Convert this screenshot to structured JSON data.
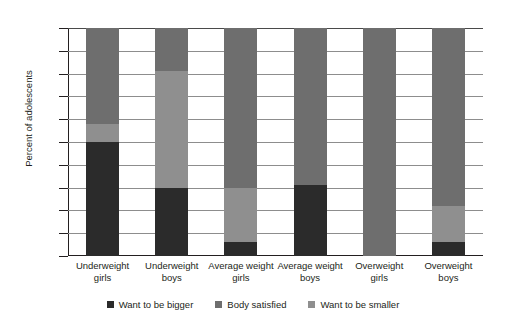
{
  "chart_data": {
    "type": "bar",
    "subtype": "stacked-bar-100",
    "title": "",
    "xlabel": "",
    "ylabel": "Percent of adolescents",
    "ylim": [
      0,
      100
    ],
    "yticks": [
      0,
      10,
      20,
      30,
      40,
      50,
      60,
      70,
      80,
      90,
      100
    ],
    "grid": true,
    "legend_position": "bottom",
    "categories": [
      "Underweight girls",
      "Underweight boys",
      "Average weight girls",
      "Average weight boys",
      "Overweight girls",
      "Overweight boys"
    ],
    "category_lines": [
      [
        "Underweight",
        "girls"
      ],
      [
        "Underweight",
        "boys"
      ],
      [
        "Average weight",
        "girls"
      ],
      [
        "Average weight",
        "boys"
      ],
      [
        "Overweight",
        "girls"
      ],
      [
        "Overweight",
        "boys"
      ]
    ],
    "series": [
      {
        "name": "Want to be bigger",
        "color": "#2b2b2b",
        "values": [
          50,
          30,
          6,
          31,
          0,
          6
        ]
      },
      {
        "name": "Want to be smaller",
        "color": "#8f8f8f",
        "values": [
          8,
          51,
          24,
          0,
          0,
          16
        ]
      },
      {
        "name": "Body satisfied",
        "color": "#6e6e6e",
        "values": [
          42,
          19,
          70,
          69,
          100,
          78
        ]
      }
    ],
    "stack_order_bottom_to_top": [
      "Want to be bigger",
      "Want to be smaller",
      "Body satisfied"
    ],
    "legend": [
      {
        "label": "Want to be bigger",
        "color": "#2b2b2b"
      },
      {
        "label": "Body satisfied",
        "color": "#6e6e6e"
      },
      {
        "label": "Want to be smaller",
        "color": "#8f8f8f"
      }
    ]
  }
}
